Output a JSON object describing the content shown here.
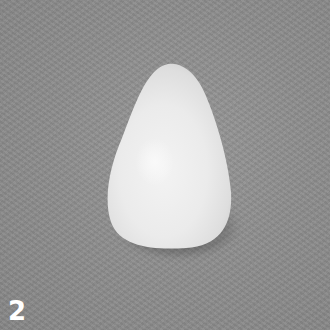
{
  "image": {
    "description": "White teardrop-shaped pebble on a gray textured background",
    "label": "2",
    "colors": {
      "background": "#8c8c8c",
      "object": "#ececec",
      "label": "#ffffff",
      "border": "#ffffff"
    }
  }
}
